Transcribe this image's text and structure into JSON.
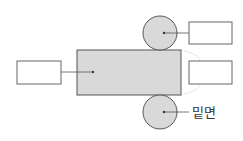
{
  "diagram": {
    "colors": {
      "face_fill": "#d9d9d9",
      "stroke": "#555555",
      "box_stroke": "#666666",
      "dotted": "#bbbbbb",
      "background": "#ffffff"
    },
    "shapes": {
      "lateral_face": {
        "x": 77,
        "y": 50,
        "width": 104,
        "height": 45,
        "label": ""
      },
      "top_base": {
        "cx": 160,
        "cy": 33,
        "r": 17,
        "label": ""
      },
      "bottom_base": {
        "cx": 160,
        "cy": 112,
        "r": 17,
        "label": "밑면"
      }
    },
    "answer_boxes": [
      {
        "id": "lateral-face-box",
        "x": 17,
        "y": 61,
        "width": 44,
        "height": 23,
        "value": ""
      },
      {
        "id": "top-base-box",
        "x": 189,
        "y": 22,
        "width": 43,
        "height": 22,
        "value": ""
      },
      {
        "id": "right-edge-box",
        "x": 189,
        "y": 61,
        "width": 43,
        "height": 23,
        "value": ""
      }
    ],
    "labels": {
      "bottom_base": "밑면"
    }
  }
}
